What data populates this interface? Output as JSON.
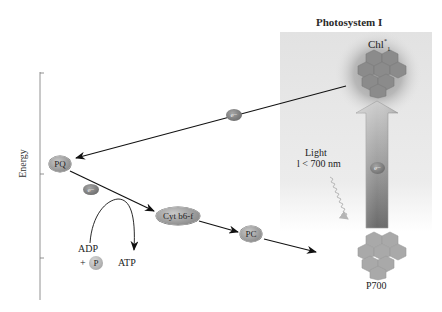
{
  "title": "Photosystem I",
  "axis": {
    "label": "Energy"
  },
  "nodes": {
    "chl": {
      "label": "Chl",
      "sup": "*",
      "sub": "1"
    },
    "p700": {
      "label": "P700"
    },
    "pq": {
      "label": "PQ"
    },
    "cyt": {
      "label": "Cyt b6-f"
    },
    "pc": {
      "label": "PC"
    },
    "electron_top": {
      "label": "e−"
    },
    "electron_pq": {
      "label": "e−"
    },
    "electron_arrow": {
      "label": "e−"
    }
  },
  "light": {
    "line1": "Light",
    "line2": "l < 700 nm"
  },
  "phosphorylation": {
    "adp": "ADP",
    "plus": "+",
    "p": "P",
    "atp": "ATP"
  },
  "colors": {
    "panel": "#e6e6e6",
    "arrow_fill_top": "#c0c0c0",
    "arrow_fill_bottom": "#6f6f6f",
    "chlorophyll": "#8a8a8a",
    "p700": "#a8a8a8",
    "line": "#111111"
  }
}
